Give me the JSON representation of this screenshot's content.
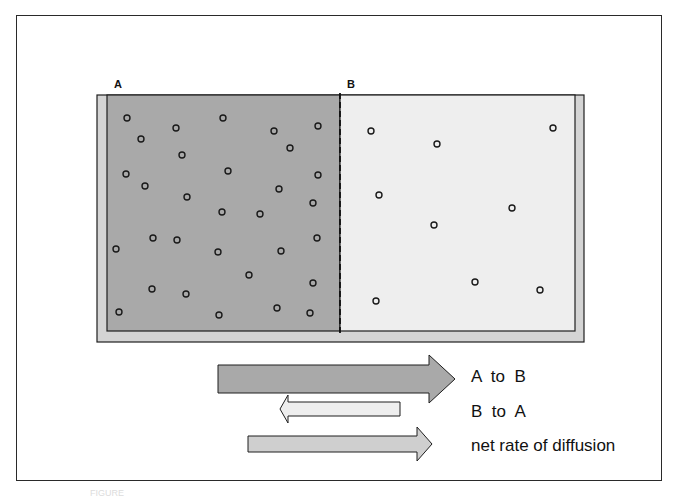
{
  "diagram": {
    "chambers": [
      {
        "label": "A",
        "fill": "#a9a9a9",
        "particle_count": 31,
        "concentration": "high"
      },
      {
        "label": "B",
        "fill": "#eeeeee",
        "particle_count": 9,
        "concentration": "low"
      }
    ],
    "divider": "dashed permeable membrane",
    "particles_A": [
      [
        127,
        118
      ],
      [
        141,
        139
      ],
      [
        176,
        128
      ],
      [
        223,
        118
      ],
      [
        274,
        131
      ],
      [
        318,
        126
      ],
      [
        290,
        148
      ],
      [
        182,
        155
      ],
      [
        126,
        174
      ],
      [
        145,
        186
      ],
      [
        228,
        171
      ],
      [
        279,
        189
      ],
      [
        318,
        175
      ],
      [
        187,
        197
      ],
      [
        222,
        212
      ],
      [
        260,
        214
      ],
      [
        313,
        203
      ],
      [
        116,
        249
      ],
      [
        153,
        238
      ],
      [
        177,
        240
      ],
      [
        218,
        252
      ],
      [
        281,
        251
      ],
      [
        317,
        238
      ],
      [
        249,
        275
      ],
      [
        152,
        289
      ],
      [
        186,
        294
      ],
      [
        313,
        283
      ],
      [
        119,
        312
      ],
      [
        219,
        315
      ],
      [
        277,
        308
      ],
      [
        310,
        313
      ]
    ],
    "particles_B": [
      [
        371,
        131
      ],
      [
        437,
        144
      ],
      [
        553,
        128
      ],
      [
        379,
        195
      ],
      [
        434,
        225
      ],
      [
        512,
        208
      ],
      [
        475,
        282
      ],
      [
        540,
        290
      ],
      [
        376,
        301
      ]
    ],
    "arrows": [
      {
        "label": "A  to  B",
        "direction": "right",
        "fill": "#a9a9a9",
        "size": "large"
      },
      {
        "label": "B  to  A",
        "direction": "left",
        "fill": "#eeeeee",
        "size": "small"
      },
      {
        "label": "net rate of diffusion",
        "direction": "right",
        "fill": "#cfcfcf",
        "size": "medium"
      }
    ],
    "colors": {
      "chamber_a": "#a9a9a9",
      "chamber_b": "#eeeeee",
      "container_rim": "#d4d4d4",
      "outline": "#1e1e1e"
    }
  },
  "caption": "FIGURE"
}
